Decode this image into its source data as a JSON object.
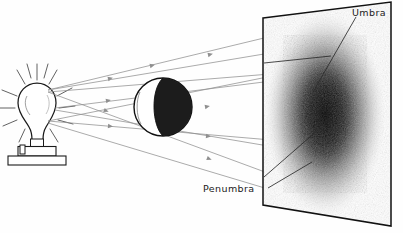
{
  "diagram": {
    "background_color": "#fefefe",
    "ink_color": "#1a1a1a",
    "ray_color": "#8f8f8f"
  },
  "labels": {
    "umbra": "Umbra",
    "penumbra": "Penumbra"
  },
  "objects": {
    "lamp": {
      "name": "light-bulb",
      "bulb_center_x": 37,
      "bulb_center_y": 104,
      "bulb_radius_x": 18,
      "bulb_radius_y": 20,
      "base_top_y": 140,
      "stand_y": 155,
      "stand_width": 58,
      "glow_ray_count": 12
    },
    "sphere": {
      "name": "opaque-sphere",
      "center_x": 163,
      "center_y": 107,
      "radius": 29,
      "lit_side": "left",
      "lit_color": "#ffffff",
      "dark_color": "#1c1c1c"
    },
    "screen": {
      "name": "projection-screen",
      "corner_top_left_x": 263,
      "corner_top_left_y": 18,
      "corner_top_right_x": 391,
      "corner_top_right_y": 2,
      "corner_bottom_right_x": 391,
      "corner_bottom_right_y": 226,
      "corner_bottom_left_x": 263,
      "corner_bottom_left_y": 205,
      "border_color": "#111111"
    },
    "shadow": {
      "name": "shadow-patch",
      "center_x": 325,
      "center_y": 114,
      "umbra_radius_x": 28,
      "umbra_radius_y": 52,
      "penumbra_radius_x": 62,
      "penumbra_radius_y": 104,
      "umbra_color": "#000000",
      "penumbra_color": "#b5b5b5"
    }
  },
  "rays": [
    {
      "name": "ray-upper-from-top",
      "x1": 48,
      "y1": 90,
      "x2": 372,
      "y2": 12
    },
    {
      "name": "ray-upper-from-bottom",
      "x1": 48,
      "y1": 121,
      "x2": 382,
      "y2": 54
    },
    {
      "name": "ray-tangent-top-upper",
      "x1": 48,
      "y1": 90,
      "x2": 300,
      "y2": 48
    },
    {
      "name": "ray-mid-upper",
      "x1": 48,
      "y1": 92,
      "x2": 332,
      "y2": 69
    },
    {
      "name": "ray-mid-lower",
      "x1": 48,
      "y1": 121,
      "x2": 330,
      "y2": 145
    },
    {
      "name": "ray-lower-from-top",
      "x1": 48,
      "y1": 92,
      "x2": 330,
      "y2": 196
    },
    {
      "name": "ray-lower-from-bottom",
      "x1": 48,
      "y1": 123,
      "x2": 308,
      "y2": 201
    }
  ],
  "leaders": [
    {
      "name": "leader-umbra",
      "x1": 356,
      "y1": 16,
      "x2": 313,
      "y2": 90
    },
    {
      "name": "leader-umbra-secondary",
      "x1": 330,
      "y1": 53,
      "x2": 264,
      "y2": 62
    },
    {
      "name": "leader-penumbra",
      "x1": 268,
      "y1": 188,
      "x2": 311,
      "y2": 163
    },
    {
      "name": "leader-penumbra-secondary",
      "x1": 263,
      "y1": 176,
      "x2": 318,
      "y2": 131
    }
  ]
}
